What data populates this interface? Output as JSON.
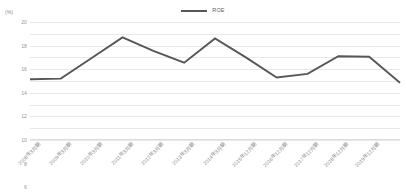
{
  "unit_label": "(%)",
  "legend": {
    "items": [
      {
        "label": "ROE",
        "color": "#575757",
        "icon": "line-swatch"
      }
    ]
  },
  "y_axis": {
    "ticks": [
      "20",
      "18",
      "16",
      "14",
      "12",
      "10",
      "8",
      "6",
      "4",
      "2",
      "0"
    ],
    "min": 0,
    "max": 20,
    "step": 2
  },
  "chart_data": {
    "type": "line",
    "title": "",
    "xlabel": "",
    "ylabel": "(%)",
    "ylim": [
      0,
      20
    ],
    "ytick_step": 2,
    "grid": true,
    "legend_position": "top-center",
    "categories": [
      "2008年3月期",
      "2009年3月期",
      "2010年3月期",
      "2011年3月期",
      "2012年3月期",
      "2013年3月期",
      "2014年3月期",
      "2015年12月期",
      "2016年12月期",
      "2017年12月期",
      "2018年12月期",
      "2019年12月期"
    ],
    "series": [
      {
        "name": "ROE",
        "color": "#575757",
        "values": [
          10.3,
          10.4,
          13.9,
          17.4,
          15.1,
          13.1,
          17.2,
          14.0,
          10.6,
          11.2,
          14.2,
          14.1
        ]
      }
    ],
    "extra_points": [
      9.7
    ]
  }
}
